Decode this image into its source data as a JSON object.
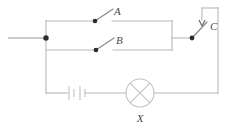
{
  "diagram": {
    "type": "schematic",
    "background_color": "#ffffff",
    "wire_color": "#b9b9b9",
    "node_color": "#2b2b2b",
    "label_color": "#4a4a4a"
  },
  "labels": {
    "switch_a": "A",
    "switch_b": "B",
    "switch_c": "C",
    "lamp": "X"
  },
  "components": [
    {
      "id": "switch-a",
      "kind": "switch",
      "label": "A",
      "state": "open",
      "branch": "upper-parallel"
    },
    {
      "id": "switch-b",
      "kind": "switch",
      "label": "B",
      "state": "open",
      "branch": "lower-parallel"
    },
    {
      "id": "switch-c",
      "kind": "switch",
      "label": "C",
      "state": "open",
      "branch": "series"
    },
    {
      "id": "lamp-x",
      "kind": "lamp",
      "label": "X",
      "symbol": "circle-with-cross",
      "branch": "bottom-series"
    },
    {
      "id": "battery",
      "kind": "battery",
      "label": "",
      "cells": 2,
      "branch": "bottom-series"
    }
  ],
  "nodes": [
    {
      "id": "left-junction",
      "label": ""
    },
    {
      "id": "switch-a-pivot",
      "label": ""
    },
    {
      "id": "switch-b-pivot",
      "label": ""
    },
    {
      "id": "switch-c-pivot",
      "label": ""
    },
    {
      "id": "switch-c-contact",
      "label": ""
    }
  ]
}
